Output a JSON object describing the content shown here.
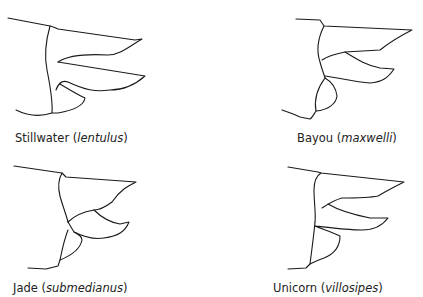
{
  "figure": {
    "panels": [
      {
        "common_name": "Stillwater",
        "species": "lentulus",
        "open": " (",
        "close": ")"
      },
      {
        "common_name": "Bayou",
        "species": "maxwelli",
        "open": " (",
        "close": ")"
      },
      {
        "common_name": "Jade",
        "species": "submedianus",
        "open": " (",
        "close": ")"
      },
      {
        "common_name": "Unicorn",
        "species": "villosipes",
        "open": " (",
        "close": ")"
      }
    ]
  }
}
